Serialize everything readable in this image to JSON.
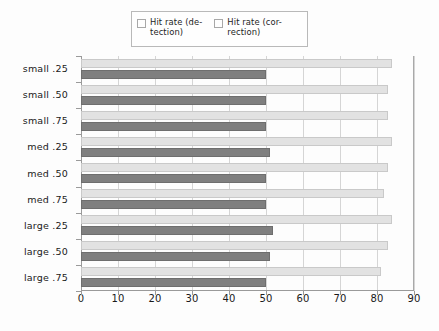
{
  "legend": {
    "position": "top-center",
    "entries": [
      {
        "label": "Hit rate (de-\ntection)",
        "swatch_color": "#e2e2e2",
        "name": "detection"
      },
      {
        "label": "Hit rate (cor-\nrection)",
        "swatch_color": "#7f7f7f",
        "name": "correction"
      }
    ]
  },
  "chart_data": {
    "type": "bar",
    "orientation": "horizontal",
    "title": "",
    "subtitle": "",
    "xlabel": "",
    "ylabel": "",
    "xlim": [
      0,
      90
    ],
    "ylim": null,
    "grid": true,
    "grid_axis": "x",
    "legend_position": "top-center",
    "categories": [
      "small .25",
      "small .50",
      "small .75",
      "med  .25",
      "med  .50",
      "med  .75",
      "large .25",
      "large .50",
      "large .75"
    ],
    "xticks": [
      0,
      10,
      20,
      30,
      40,
      50,
      60,
      70,
      80,
      90
    ],
    "xtick_labels": [
      "0",
      "10",
      "20",
      "30",
      "40",
      "50",
      "60",
      "70",
      "80",
      "90"
    ],
    "series": [
      {
        "name": "Hit rate (detection)",
        "color": "#e2e2e2",
        "values": [
          84,
          83,
          83,
          84,
          83,
          82,
          84,
          83,
          81
        ]
      },
      {
        "name": "Hit rate (correction)",
        "color": "#7f7f7f",
        "values": [
          50,
          50,
          50,
          51,
          50,
          50,
          52,
          51,
          50
        ]
      }
    ]
  }
}
